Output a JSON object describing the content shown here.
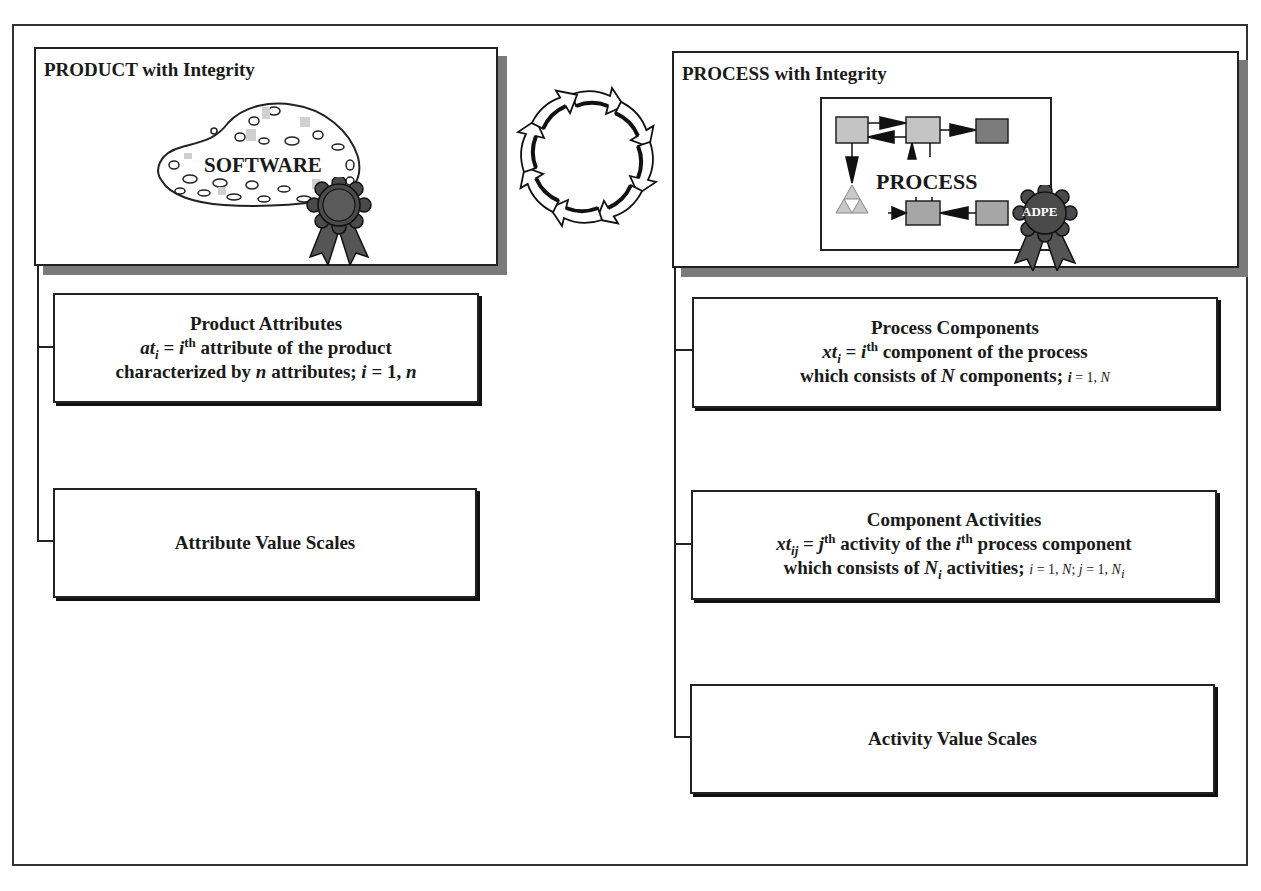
{
  "product_panel": {
    "title": "PRODUCT with Integrity",
    "illustration_label": "SOFTWARE",
    "icons": [
      "software-blob-icon",
      "award-ribbon-icon"
    ]
  },
  "process_panel": {
    "title": "PROCESS with Integrity",
    "illustration_label": "PROCESS",
    "ribbon_label": "ADPE",
    "icons": [
      "process-flow-diagram-icon",
      "award-ribbon-icon"
    ]
  },
  "cycle_icon": "circular-arrows-cycle-icon",
  "product_boxes": [
    {
      "heading": "Product Attributes",
      "line1": {
        "sym": "at",
        "sub": "i",
        "eq": " = ",
        "idx": "i",
        "sup": "th",
        "text": " attribute of the product"
      },
      "line2": {
        "pre": "characterized by ",
        "var": "n",
        "mid": " attributes; ",
        "idx": "i",
        "eq": " = 1, ",
        "end": "n"
      }
    },
    {
      "heading": "Attribute Value Scales"
    }
  ],
  "process_boxes": [
    {
      "heading": "Process Components",
      "line1": {
        "sym": "xt",
        "sub": "i",
        "eq": " = ",
        "idx": "i",
        "sup": "th",
        "text": " component of the process"
      },
      "line2": {
        "pre": "which consists of ",
        "var": "N",
        "mid": " components; ",
        "idx": "i",
        "eq": " = 1, ",
        "end": "N"
      }
    },
    {
      "heading": "Component Activities",
      "line1": {
        "sym": "xt",
        "sub": "ij",
        "eq": " = ",
        "idx": "j",
        "sup": "th",
        "text": " activity of the ",
        "idx2": "i",
        "sup2": "th",
        "text2": " process component"
      },
      "line2": {
        "pre": "which consists of ",
        "var": "N",
        "varsub": "i",
        "mid": " activities;  ",
        "idx": "i",
        "eq": " = 1, ",
        "end": "N",
        "sep": "; ",
        "idx2": "j",
        "eq2": " = 1, ",
        "end2": "N",
        "end2sub": "i"
      }
    },
    {
      "heading": "Activity Value Scales"
    }
  ],
  "colors": {
    "shadow": "#7a7a7a",
    "ribbon": "#4a4a4a",
    "box_light": "#c8c8c8",
    "box_mid": "#a8a8a8",
    "box_dark": "#7c7c7c"
  }
}
